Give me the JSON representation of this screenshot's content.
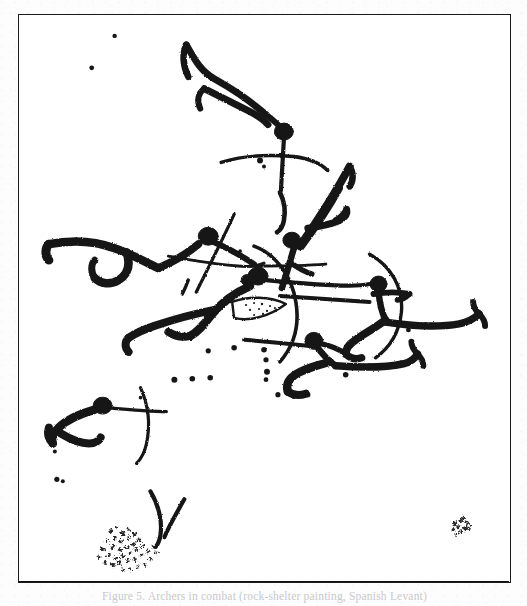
{
  "figure": {
    "caption": "Figure 5. Archers in combat (rock-shelter painting, Spanish Levant)",
    "caption_visible": "partially cut off at page edge",
    "ink_color": "#151515",
    "paper_color": "#ffffff",
    "frame_color": "#1b1b1b",
    "frame": {
      "x": 18,
      "y": 14,
      "width": 493,
      "height": 569
    },
    "element_counts": {
      "archer_figures": 7,
      "bows": 7,
      "loose_arrows": 6,
      "dot_marks": 22,
      "stippled_blobs": 2
    },
    "archers": [
      {
        "name": "top-archer-falling",
        "position": "upper centre",
        "description": "inverted archer with drawn bow, head at lower right"
      },
      {
        "name": "left-running-archer",
        "position": "middle left",
        "description": "running archer, bow held forward, arrow crossing body"
      },
      {
        "name": "centre-leaning-archer",
        "position": "centre upper",
        "description": "leaning archer with long raised bow"
      },
      {
        "name": "centre-prone-archer",
        "position": "centre",
        "description": "prone archer with rounded head and stippled shield shape"
      },
      {
        "name": "right-archer",
        "position": "middle right",
        "description": "upright archer with bow, dots trailing below"
      },
      {
        "name": "lower-centre-archer",
        "position": "lower centre",
        "description": "archer shooting left, dots beneath"
      },
      {
        "name": "lower-left-archer",
        "position": "lower left",
        "description": "crouching archer with bow, arrow drawn"
      }
    ],
    "marks": [
      {
        "name": "stipple-blob-large",
        "position": "bottom left",
        "description": "dense speckled smudge of pigment"
      },
      {
        "name": "stipple-blob-small",
        "position": "bottom right",
        "description": "small round speckled dot cluster"
      },
      {
        "name": "curved-stroke-pair",
        "position": "bottom centre-left",
        "description": "two thin crescent strokes"
      }
    ]
  }
}
